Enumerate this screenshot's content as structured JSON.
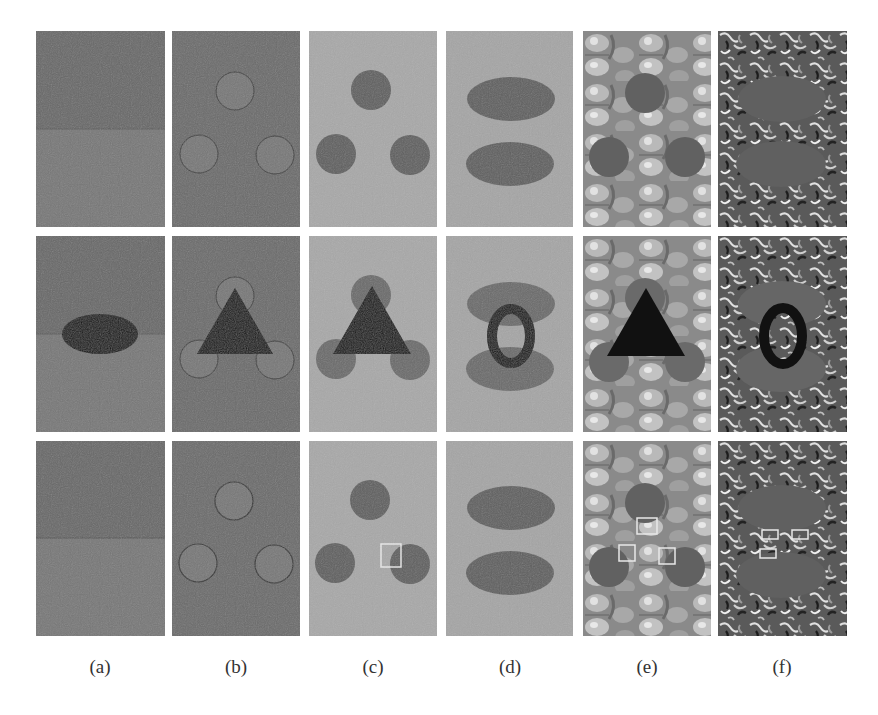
{
  "figure": {
    "columns": [
      {
        "id": "a",
        "label": "(a)",
        "background": "#6f6f6f",
        "shapes": "two half-planes (darker top, lighter bottom) separated by a horizontal edge"
      },
      {
        "id": "b",
        "label": "(b)",
        "background": "#6c6c6c",
        "shapes": "three circles with dark outlines"
      },
      {
        "id": "c",
        "label": "(c)",
        "background": "#a9a9a9",
        "shapes": "three dark filled circles"
      },
      {
        "id": "d",
        "label": "(d)",
        "background": "#a5a5a5",
        "shapes": "two dark horizontal ellipses"
      },
      {
        "id": "e",
        "label": "(e)",
        "background": "textured (pumpkin pattern)",
        "shapes": "three dark circles on texture"
      },
      {
        "id": "f",
        "label": "(f)",
        "background": "textured (noise pattern)",
        "shapes": "two dark ellipses on texture"
      }
    ],
    "rows": [
      {
        "id": "row-1",
        "description": "input images"
      },
      {
        "id": "row-2",
        "description": "occluded inputs (black ellipse / triangle / ring occluder)"
      },
      {
        "id": "row-3",
        "description": "completion results with highlighted boxes"
      }
    ],
    "occluders": {
      "a": "black horizontal ellipse",
      "b": "black triangle",
      "c": "black triangle",
      "d": "black elliptical ring",
      "e": "black triangle",
      "f": "black elliptical ring"
    },
    "highlight_boxes": {
      "c": 1,
      "e": 3,
      "f": 3
    },
    "colors": {
      "occluder": "#111111",
      "highlight_box": "#e8e8e8",
      "dark_region": "#5e5e5e",
      "outline": "#3a3a3a"
    }
  }
}
